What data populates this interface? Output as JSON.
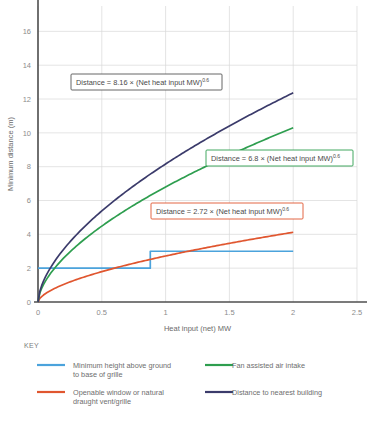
{
  "chart_data": {
    "type": "line",
    "title": "",
    "xlabel": "Heat input (net) MW",
    "ylabel": "Minimum distance (m)",
    "xlim": [
      0,
      2.5
    ],
    "ylim": [
      0,
      17.5
    ],
    "xticks": [
      "0",
      "0.5",
      "1",
      "1.5",
      "2",
      "2.5"
    ],
    "xtick_values": [
      0,
      0.5,
      1,
      1.5,
      2,
      2.5
    ],
    "yticks": [
      "0",
      "2",
      "4",
      "6",
      "8",
      "10",
      "12",
      "14",
      "16"
    ],
    "ytick_values": [
      0,
      2,
      4,
      6,
      8,
      10,
      12,
      14,
      16
    ],
    "grid": true,
    "legend_position": "below-plot",
    "series": [
      {
        "name": "Minimum height above ground to base of grille",
        "color": "#4ba3dc",
        "kind": "step",
        "points": [
          [
            0,
            2
          ],
          [
            0.88,
            2
          ],
          [
            0.88,
            3
          ],
          [
            2,
            3
          ]
        ]
      },
      {
        "name": "Openable window or natural draught vent/grille",
        "color": "#e0562f",
        "kind": "power",
        "coefficient": 2.72,
        "exponent": 0.6,
        "x_range": [
          0,
          2
        ],
        "end_value": 4.6
      },
      {
        "name": "Fan assisted air intake",
        "color": "#2e9e4f",
        "kind": "power",
        "coefficient": 6.8,
        "exponent": 0.6,
        "x_range": [
          0,
          2
        ],
        "end_value": 11.8
      },
      {
        "name": "Distance to nearest building",
        "color": "#3b3b6b",
        "kind": "power",
        "coefficient": 8.16,
        "exponent": 0.6,
        "x_range": [
          0,
          2
        ],
        "end_value": 14.0
      }
    ],
    "annotations": [
      {
        "id": "navy",
        "text_prefix": "Distance = 8.16 × (Net heat input MW)",
        "text_sup": "0.6",
        "border_color": "#555555",
        "x": 71,
        "y": 74,
        "width": 151,
        "height": 16
      },
      {
        "id": "green",
        "text_prefix": "Distance = 6.8 × (Net heat input MW)",
        "text_sup": "0.6",
        "border_color": "#2e9e4f",
        "x": 206,
        "y": 150,
        "width": 147,
        "height": 16
      },
      {
        "id": "orange",
        "text_prefix": "Distance = 2.72 × (Net heat input MW)",
        "text_sup": "0.6",
        "border_color": "#e0562f",
        "x": 151,
        "y": 203,
        "width": 152,
        "height": 16
      }
    ]
  },
  "key": {
    "header": "KEY",
    "items": [
      {
        "label_line1": "Minimum height above ground",
        "label_line2": "to base of grille",
        "color": "#4ba3dc"
      },
      {
        "label_line1": "Fan assisted air intake",
        "label_line2": "",
        "color": "#2e9e4f"
      },
      {
        "label_line1": "Openable window or natural",
        "label_line2": "draught vent/grille",
        "color": "#e0562f"
      },
      {
        "label_line1": "Distance to nearest building",
        "label_line2": "",
        "color": "#3b3b6b"
      }
    ]
  }
}
